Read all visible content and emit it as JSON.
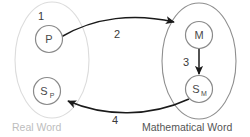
{
  "diagram": {
    "regions": [
      {
        "id": "real-word",
        "label": "Real Word",
        "color": "#d8d8d8",
        "label_color": "#bdbdbd"
      },
      {
        "id": "mathematical-word",
        "label": "Mathematical Word",
        "color": "#8a8a8a",
        "label_color": "#555555"
      }
    ],
    "nodes": [
      {
        "id": "p",
        "label": "P",
        "sub": "",
        "region": "real-word"
      },
      {
        "id": "sp",
        "label": "S",
        "sub": "P",
        "region": "real-word"
      },
      {
        "id": "m",
        "label": "M",
        "sub": "",
        "region": "mathematical-word"
      },
      {
        "id": "sm",
        "label": "S",
        "sub": "M",
        "region": "mathematical-word"
      }
    ],
    "edges": [
      {
        "id": "edge-1",
        "label": "1",
        "from": "",
        "to": "p",
        "style": "none"
      },
      {
        "id": "edge-2",
        "label": "2",
        "from": "p",
        "to": "m",
        "style": "curve"
      },
      {
        "id": "edge-3",
        "label": "3",
        "from": "m",
        "to": "sm",
        "style": "straight"
      },
      {
        "id": "edge-4",
        "label": "4",
        "from": "sm",
        "to": "sp",
        "style": "curve"
      }
    ],
    "stroke_color": "#1a1a1a",
    "node_stroke_color": "#8a8a8a"
  }
}
